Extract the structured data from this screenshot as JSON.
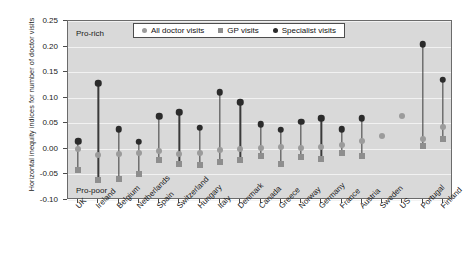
{
  "chart_data": {
    "type": "scatter",
    "title": "",
    "xlabel": "",
    "ylabel": "Horizontal inequity indices for number of doctor visits",
    "ylim": [
      -0.1,
      0.25
    ],
    "ytick_values": [
      0.25,
      0.2,
      0.15,
      0.1,
      0.05,
      0.0,
      -0.05,
      -0.1
    ],
    "ytick_labels": [
      "0.25",
      "0.20",
      "0.15",
      "0.10",
      "0.05",
      "0.00",
      "-0.05",
      "-0.10"
    ],
    "grid": true,
    "legend_position": "top-center",
    "annotations": [
      {
        "text": "Pro-rich",
        "value": 0.225
      },
      {
        "text": "Pro-poor",
        "value": -0.082
      }
    ],
    "categories": [
      "UK",
      "Ireland",
      "Belgium",
      "Netherlands",
      "Spain",
      "Switzerland",
      "Hungary",
      "Italy",
      "Denmark",
      "Canada",
      "Greece",
      "Norway",
      "Germany",
      "France",
      "Austria",
      "Sweden",
      "US",
      "Portugal",
      "Finland"
    ],
    "series": [
      {
        "name": "All doctor visits",
        "marker": "circle",
        "color": "#9b9b9b",
        "values": [
          0.0,
          -0.012,
          -0.011,
          -0.008,
          -0.004,
          -0.011,
          -0.008,
          -0.002,
          0.0,
          0.002,
          0.004,
          0.002,
          0.003,
          0.008,
          0.015,
          0.025,
          0.065,
          0.02,
          0.042
        ]
      },
      {
        "name": "GP visits",
        "marker": "square",
        "color": "#8e8e8e",
        "values": [
          -0.042,
          -0.06,
          -0.058,
          -0.05,
          -0.022,
          -0.03,
          -0.031,
          -0.026,
          -0.022,
          -0.013,
          -0.03,
          -0.015,
          -0.019,
          -0.008,
          -0.014,
          null,
          null,
          0.005,
          0.02
        ]
      },
      {
        "name": "Specialist visits",
        "marker": "circle-dark",
        "color": "#2b2b2b",
        "values": [
          0.015,
          0.128,
          0.038,
          0.014,
          0.064,
          0.072,
          0.041,
          0.111,
          0.091,
          0.048,
          0.037,
          0.053,
          0.06,
          0.038,
          0.06,
          null,
          null,
          0.205,
          0.135
        ]
      }
    ]
  },
  "legend": {
    "items": [
      {
        "label": "All doctor visits",
        "marker": "circle",
        "color": "#9b9b9b"
      },
      {
        "label": "GP visits",
        "marker": "square",
        "color": "#8e8e8e"
      },
      {
        "label": "Specialist visits",
        "marker": "circle-dark",
        "color": "#2b2b2b"
      }
    ]
  }
}
